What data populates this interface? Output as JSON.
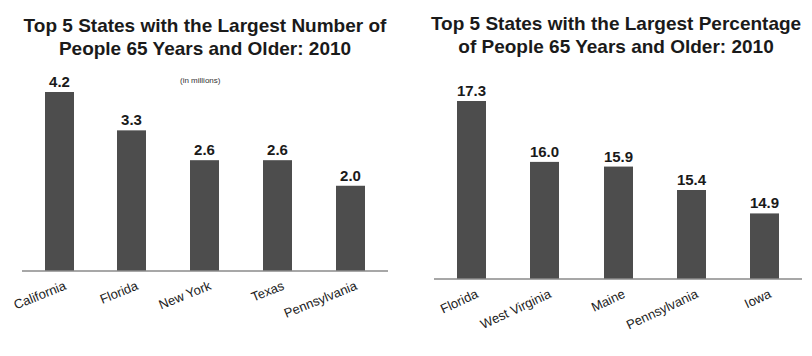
{
  "chart_data": [
    {
      "type": "bar",
      "title": "Top 5 States with the Largest Number of People 65 Years and Older: 2010",
      "subtitle": "(in millions)",
      "categories": [
        "California",
        "Florida",
        "New York",
        "Texas",
        "Pennsylvania"
      ],
      "values": [
        4.2,
        3.3,
        2.6,
        2.6,
        2.0
      ],
      "value_labels": [
        "4.2",
        "3.3",
        "2.6",
        "2.6",
        "2.0"
      ],
      "xlabel": "",
      "ylabel": "",
      "ylim": [
        0,
        4.2
      ],
      "grid": false,
      "bar_color": "#4d4d4d"
    },
    {
      "type": "bar",
      "title": "Top 5 States with the Largest Percentage of People 65 Years and Older: 2010",
      "subtitle": "",
      "categories": [
        "Florida",
        "West Virginia",
        "Maine",
        "Pennsylvania",
        "Iowa"
      ],
      "values": [
        17.3,
        16.0,
        15.9,
        15.4,
        14.9
      ],
      "value_labels": [
        "17.3",
        "16.0",
        "15.9",
        "15.4",
        "14.9"
      ],
      "xlabel": "",
      "ylabel": "",
      "ylim": [
        13.5,
        17.3
      ],
      "grid": false,
      "bar_color": "#4d4d4d"
    }
  ]
}
